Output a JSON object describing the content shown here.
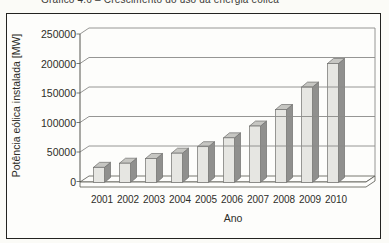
{
  "figure": {
    "caption": "Gráfico 4.6 – Crescimento do uso da energia eólica",
    "xlabel": "Ano",
    "ylabel": "Potência eólica instalada [MW]"
  },
  "chart_data": {
    "type": "bar",
    "subtype": "3d-column",
    "title": "Gráfico 4.6 – Crescimento do uso da energia eólica",
    "categories": [
      "2001",
      "2002",
      "2003",
      "2004",
      "2005",
      "2006",
      "2007",
      "2008",
      "2009",
      "2010"
    ],
    "values": [
      24000,
      31000,
      39000,
      48000,
      59000,
      74000,
      94000,
      122000,
      160000,
      200000
    ],
    "series_name": "Potência eólica instalada",
    "xlabel": "Ano",
    "ylabel": "Potência eólica instalada [MW]",
    "ylim": [
      0,
      250000
    ],
    "ytick_interval": 50000,
    "ytick_labels": [
      "0",
      "50000",
      "100000",
      "150000",
      "200000",
      "250000"
    ],
    "grid": true,
    "legend": false
  },
  "colors": {
    "background": "#fbfbf7",
    "wall": "#fdfdfb",
    "border": "#232320",
    "bar_front": "#e6e6e2",
    "bar_side": "#90908e",
    "bar_top": "#c6c6c2",
    "bar_outline": "#6f6f6d",
    "gridline": "#8a8a88",
    "axis": "#55554f",
    "text": "#2d2d28"
  }
}
